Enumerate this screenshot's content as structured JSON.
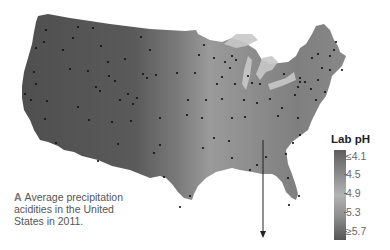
{
  "caption": {
    "letter": "A",
    "text": "Average precipitation acidities in the United States in 2011."
  },
  "legend": {
    "title": "Lab pH",
    "ticks": [
      "≤4.1",
      "4.5",
      "4.9",
      "5.3",
      "≥5.7"
    ],
    "colors": {
      "low": "#5e5e5e",
      "mid": "#b3b3b3",
      "high": "#555555"
    }
  },
  "map": {
    "region": "Contiguous United States",
    "year": "2011",
    "measure": "Average precipitation pH (lab)",
    "annotation": "vertical arrow pointing south from southeastern US"
  }
}
